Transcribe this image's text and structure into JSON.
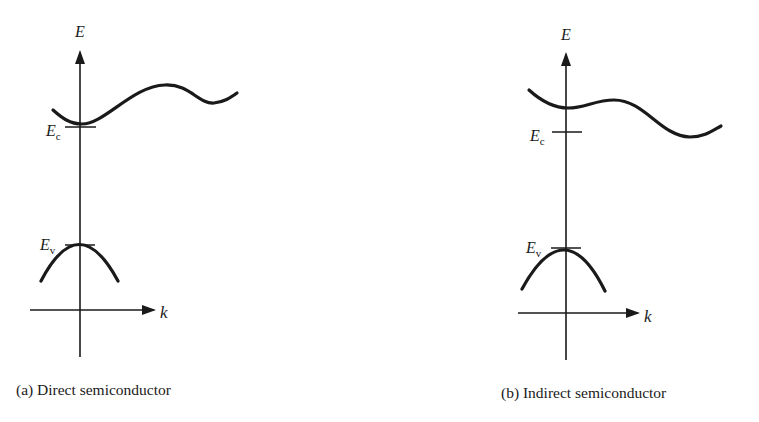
{
  "figure": {
    "panels": [
      {
        "id": "a",
        "caption": "(a) Direct semiconductor",
        "axis_y_label": "E",
        "axis_x_label": "k",
        "conduction_label": "E",
        "conduction_sub": "c",
        "valence_label": "E",
        "valence_sub": "v",
        "note": "Conduction band minimum aligned with valence band maximum at k = 0"
      },
      {
        "id": "b",
        "caption": "(b) Indirect semiconductor",
        "axis_y_label": "E",
        "axis_x_label": "k",
        "conduction_label": "E",
        "conduction_sub": "c",
        "valence_label": "E",
        "valence_sub": "v",
        "note": "Conduction band minimum offset from k = 0"
      }
    ],
    "colors": {
      "ink": "#1a1a1a",
      "background": "#ffffff"
    }
  }
}
